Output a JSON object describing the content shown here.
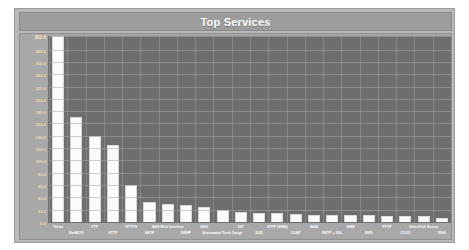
{
  "panel": {
    "title": "Top Services",
    "title_bar_color": "#9d9d9d",
    "panel_bg": "#b9b9b9",
    "plot_bg": "#6e6e6e",
    "bar_color": "#fbfbfb",
    "grid_color": "#a8a8a8",
    "tick_label_color": "#f2d9a0",
    "axis_label_color": "#ffffff"
  },
  "chart_data": {
    "type": "bar",
    "title": "Top Services",
    "xlabel": "",
    "ylabel": "",
    "ylim": [
      0,
      302
    ],
    "grid": true,
    "legend": "none",
    "orientation": "vertical",
    "yticks": [
      "302.0",
      "280.0",
      "260.0",
      "240.0",
      "220.0",
      "200.0",
      "180.0",
      "160.0",
      "140.0",
      "120.0",
      "100.0",
      "80.0",
      "60.0",
      "40.0",
      "20.0",
      "0.0"
    ],
    "ytick_values": [
      302,
      280,
      260,
      240,
      220,
      200,
      180,
      160,
      140,
      120,
      100,
      80,
      60,
      40,
      20,
      0
    ],
    "categories": [
      "Telnet",
      "NetBIOS",
      "FTP",
      "HTTP",
      "HTTPS",
      "SMTP",
      "NAS Web Interface",
      "SNMP",
      "9001",
      "Automated Tank Gauge",
      "587",
      "2222",
      "HTTP (8080)",
      "LDAP",
      "4444",
      "SMTP + SSL",
      "8888",
      "SMS",
      "PPTP",
      "27015",
      "GlassFish Server",
      "5900"
    ],
    "label_rows": [
      0,
      1,
      0,
      1,
      0,
      1,
      0,
      1,
      0,
      1,
      0,
      1,
      0,
      1,
      0,
      1,
      0,
      1,
      0,
      1,
      0,
      1
    ],
    "values": [
      302,
      170,
      140,
      125,
      60,
      32,
      30,
      28,
      24,
      20,
      17,
      15,
      14,
      13,
      12,
      12,
      11,
      11,
      10,
      10,
      9,
      7
    ]
  }
}
